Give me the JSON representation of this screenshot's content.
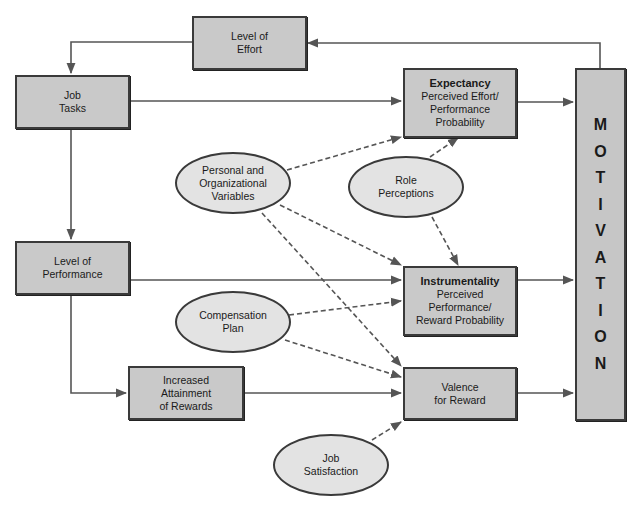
{
  "diagram": {
    "type": "flow-diagram",
    "colors": {
      "box_fill": "#c9c9c9",
      "ellipse_fill": "#e3e3e3",
      "border": "#3a3a3a",
      "line": "#555555"
    },
    "boxes": {
      "level_of_effort": {
        "lines": [
          "Level of",
          "Effort"
        ]
      },
      "job_tasks": {
        "lines": [
          "Job",
          "Tasks"
        ]
      },
      "level_of_performance": {
        "lines": [
          "Level of",
          "Performance"
        ]
      },
      "increased_attainment": {
        "lines": [
          "Increased",
          "Attainment",
          "of Rewards"
        ]
      },
      "expectancy": {
        "title": "Expectancy",
        "lines": [
          "Perceived Effort/",
          "Performance",
          "Probability"
        ]
      },
      "instrumentality": {
        "title": "Instrumentality",
        "lines": [
          "Perceived",
          "Performance/",
          "Reward Probability"
        ]
      },
      "valence": {
        "lines": [
          "Valence",
          "for Reward"
        ]
      }
    },
    "ellipses": {
      "personal_org": {
        "lines": [
          "Personal and",
          "Organizational",
          "Variables"
        ]
      },
      "role_perceptions": {
        "lines": [
          "Role",
          "Perceptions"
        ]
      },
      "compensation_plan": {
        "lines": [
          "Compensation",
          "Plan"
        ]
      },
      "job_satisfaction": {
        "lines": [
          "Job",
          "Satisfaction"
        ]
      }
    },
    "motivation": {
      "letters": [
        "M",
        "O",
        "T",
        "I",
        "V",
        "A",
        "T",
        "I",
        "O",
        "N"
      ]
    },
    "edges": [
      {
        "from": "Motivation",
        "to": "Level of Effort",
        "style": "solid"
      },
      {
        "from": "Level of Effort",
        "to": "Job Tasks",
        "style": "solid"
      },
      {
        "from": "Job Tasks",
        "to": "Expectancy",
        "style": "solid"
      },
      {
        "from": "Job Tasks",
        "to": "Level of Performance",
        "style": "solid"
      },
      {
        "from": "Level of Performance",
        "to": "Instrumentality",
        "style": "solid"
      },
      {
        "from": "Level of Performance",
        "to": "Increased Attainment of Rewards",
        "style": "solid"
      },
      {
        "from": "Increased Attainment of Rewards",
        "to": "Valence for Reward",
        "style": "solid"
      },
      {
        "from": "Expectancy",
        "to": "Motivation",
        "style": "solid"
      },
      {
        "from": "Instrumentality",
        "to": "Motivation",
        "style": "solid"
      },
      {
        "from": "Valence for Reward",
        "to": "Motivation",
        "style": "solid"
      },
      {
        "from": "Personal and Organizational Variables",
        "to": "Expectancy",
        "style": "dashed"
      },
      {
        "from": "Personal and Organizational Variables",
        "to": "Instrumentality",
        "style": "dashed"
      },
      {
        "from": "Personal and Organizational Variables",
        "to": "Valence for Reward",
        "style": "dashed"
      },
      {
        "from": "Role Perceptions",
        "to": "Expectancy",
        "style": "dashed"
      },
      {
        "from": "Role Perceptions",
        "to": "Instrumentality",
        "style": "dashed"
      },
      {
        "from": "Compensation Plan",
        "to": "Instrumentality",
        "style": "dashed"
      },
      {
        "from": "Compensation Plan",
        "to": "Valence for Reward",
        "style": "dashed"
      },
      {
        "from": "Job Satisfaction",
        "to": "Valence for Reward",
        "style": "dashed"
      }
    ]
  }
}
